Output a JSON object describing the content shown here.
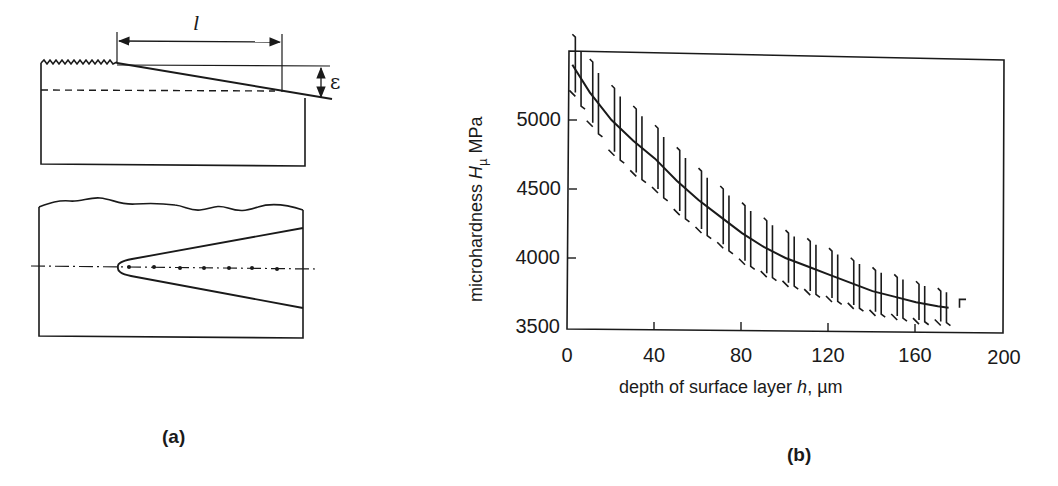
{
  "panel_a": {
    "caption": "(a)",
    "top_figure": {
      "length_symbol": "l",
      "depth_symbol": "ε",
      "description": "Rectangular block with serrated top surface on the left, taper line descending to the right; dimension l along the taper, depth ε at right end; dashed reference line"
    },
    "bottom_figure": {
      "description": "Block with wavy top surface, wedge-shaped (cone) region opening to the right with rounded tip, dash-dot centerline with dot markers"
    }
  },
  "panel_b": {
    "caption": "(b)",
    "x_axis_label_prefix": "depth of surface layer ",
    "x_axis_symbol": "h",
    "x_axis_label_suffix": ", µm",
    "y_axis_label_prefix": "microhardness ",
    "y_axis_symbol": "H",
    "y_axis_subscript": "µ",
    "y_axis_label_suffix": " MPa",
    "x_ticks": [
      "0",
      "40",
      "80",
      "120",
      "160",
      "200"
    ],
    "y_ticks": [
      "5000",
      "4500",
      "4000",
      "3500"
    ]
  },
  "chart_data": {
    "type": "line",
    "title": "",
    "xlabel": "depth of surface layer h, µm",
    "ylabel": "microhardness Hµ MPa",
    "xlim": [
      0,
      200
    ],
    "ylim": [
      3500,
      5500
    ],
    "x_tick_labels": [
      "0",
      "40",
      "80",
      "120",
      "160",
      "200"
    ],
    "y_tick_labels": [
      "3500",
      "4000",
      "4500",
      "5000"
    ],
    "grid": false,
    "legend": null,
    "series": [
      {
        "name": "mean microhardness",
        "x": [
          2,
          10,
          20,
          30,
          40,
          50,
          60,
          70,
          80,
          90,
          100,
          110,
          120,
          130,
          140,
          150,
          160,
          170,
          175
        ],
        "y": [
          5400,
          5200,
          5000,
          4850,
          4720,
          4560,
          4420,
          4300,
          4180,
          4080,
          4000,
          3940,
          3880,
          3820,
          3760,
          3720,
          3680,
          3650,
          3640
        ]
      },
      {
        "name": "scatter band (error bars, approx. ±)",
        "x": [
          2,
          10,
          20,
          30,
          40,
          50,
          60,
          70,
          80,
          90,
          100,
          110,
          120,
          130,
          140,
          150,
          160,
          170
        ],
        "y_err": [
          200,
          220,
          230,
          230,
          220,
          220,
          210,
          200,
          200,
          190,
          180,
          180,
          170,
          160,
          150,
          140,
          130,
          110
        ]
      }
    ]
  }
}
